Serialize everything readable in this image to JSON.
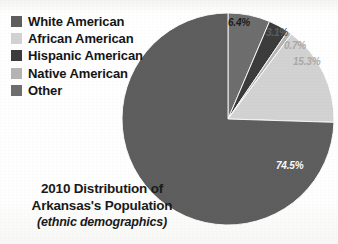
{
  "background_color": "#fdfdfb",
  "legend": {
    "position": "top-left",
    "items": [
      {
        "label": "White American",
        "color": "#5e5e5e"
      },
      {
        "label": "African American",
        "color": "#d2d2d2"
      },
      {
        "label": "Hispanic American",
        "color": "#3c3c3c"
      },
      {
        "label": "Native American",
        "color": "#b4b4b4"
      },
      {
        "label": "Other",
        "color": "#6e6e6e"
      }
    ]
  },
  "caption": {
    "line1": "2010 Distribution of",
    "line2": "Arkansas's Population",
    "line3": "(ethnic demographics)"
  },
  "chart_data": {
    "type": "pie",
    "title": "2010 Distribution of Arkansas's Population",
    "subtitle": "(ethnic demographics)",
    "xlabel": "",
    "ylabel": "",
    "legend_position": "left",
    "grid": false,
    "start_angle_deg": 0,
    "direction": "clockwise",
    "units": "percent",
    "categories": [
      "Other",
      "Hispanic American",
      "Native American",
      "African American",
      "White American"
    ],
    "values": [
      6.4,
      3.1,
      0.7,
      15.3,
      74.5
    ],
    "colors": [
      "#6e6e6e",
      "#3c3c3c",
      "#b4b4b4",
      "#d2d2d2",
      "#5e5e5e"
    ],
    "slices": [
      {
        "name": "Other",
        "value": 6.4,
        "label": "6.4%",
        "color": "#6e6e6e",
        "label_tone": "dark"
      },
      {
        "name": "Hispanic American",
        "value": 3.1,
        "label": "3.1%",
        "color": "#3c3c3c",
        "label_tone": "mid"
      },
      {
        "name": "Native American",
        "value": 0.7,
        "label": "0.7%",
        "color": "#b4b4b4",
        "label_tone": "light"
      },
      {
        "name": "African American",
        "value": 15.3,
        "label": "15.3%",
        "color": "#d2d2d2",
        "label_tone": "light"
      },
      {
        "name": "White American",
        "value": 74.5,
        "label": "74.5%",
        "color": "#5e5e5e",
        "label_tone": "white"
      }
    ]
  },
  "pie_geometry": {
    "center_x": 228,
    "center_y": 119,
    "radius": 106
  }
}
